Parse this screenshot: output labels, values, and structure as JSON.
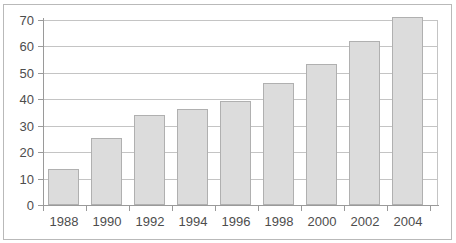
{
  "chart_data": {
    "type": "bar",
    "title": "",
    "subtitle": "",
    "xlabel": "",
    "ylabel": "",
    "categories": [
      "1988",
      "1990",
      "1992",
      "1994",
      "1996",
      "1998",
      "2000",
      "2002",
      "2004"
    ],
    "values": [
      13.8,
      25.5,
      34.0,
      36.2,
      39.5,
      46.0,
      53.5,
      62.0,
      71.0
    ],
    "series": [
      {
        "name": "",
        "values": [
          13.8,
          25.5,
          34.0,
          36.2,
          39.5,
          46.0,
          53.5,
          62.0,
          71.0
        ]
      }
    ],
    "ylim": [
      0,
      70
    ],
    "ytick_values": [
      0,
      10,
      20,
      30,
      40,
      50,
      60,
      70
    ],
    "ytick_labels": [
      "0",
      "10",
      "20",
      "30",
      "40",
      "50",
      "60",
      "70"
    ],
    "xtick_labels": [
      "1988",
      "1990",
      "1992",
      "1994",
      "1996",
      "1998",
      "2000",
      "2002",
      "2004"
    ],
    "grid": "horizontal",
    "legend": "none",
    "annotations": [],
    "colors": {
      "bar_fill": "#dcdcdc",
      "bar_stroke": "#b0b0b0",
      "gridline": "#c4c4c4",
      "axis": "#9a9a9a",
      "text": "#4d4d4d",
      "background": "#ffffff",
      "frame": "#b9b9b9"
    }
  }
}
